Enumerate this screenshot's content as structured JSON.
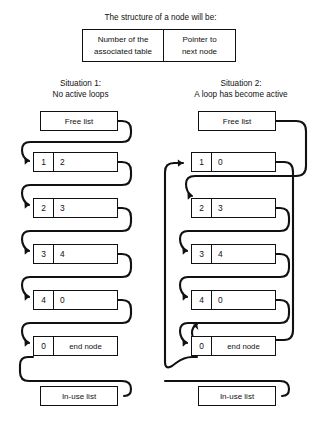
{
  "header": {
    "intro": "The structure of a node will be:",
    "node_struct": {
      "left_label": "Number of the associated table",
      "left_line1": "Number of the",
      "left_line2": "associated table",
      "right_label": "Pointer to next node",
      "right_line1": "Pointer to",
      "right_line2": "next node"
    }
  },
  "situations": [
    {
      "id": "situation-1",
      "title": "Situation 1:",
      "subtitle": "No active loops",
      "head_label": "Free list",
      "tail_label": "In-use list",
      "nodes": [
        {
          "table": "1",
          "pointer": "2"
        },
        {
          "table": "2",
          "pointer": "3"
        },
        {
          "table": "3",
          "pointer": "4"
        },
        {
          "table": "4",
          "pointer": "0"
        },
        {
          "table": "0",
          "pointer": "end node"
        }
      ]
    },
    {
      "id": "situation-2",
      "title": "Situation 2:",
      "subtitle": "A loop has become active",
      "head_label": "Free list",
      "tail_label": "In-use list",
      "nodes": [
        {
          "table": "1",
          "pointer": "0"
        },
        {
          "table": "2",
          "pointer": "3"
        },
        {
          "table": "3",
          "pointer": "4"
        },
        {
          "table": "4",
          "pointer": "0"
        },
        {
          "table": "0",
          "pointer": "end node"
        }
      ]
    }
  ],
  "style": {
    "line_color": "#111111",
    "box_border": "#111111",
    "background": "#ffffff"
  }
}
